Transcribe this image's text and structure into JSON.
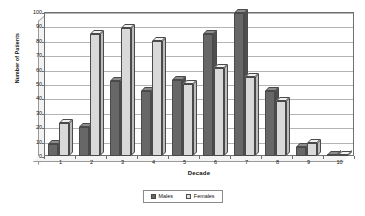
{
  "chart_data": {
    "type": "bar",
    "title": "",
    "xlabel": "Decade",
    "ylabel": "Number of Patients",
    "categories": [
      "1",
      "2",
      "3",
      "4",
      "5",
      "6",
      "7",
      "8",
      "9",
      "10"
    ],
    "series": [
      {
        "name": "Males",
        "values": [
          8,
          20,
          52,
          45,
          53,
          85,
          99,
          45,
          6,
          1
        ]
      },
      {
        "name": "Females",
        "values": [
          23,
          85,
          89,
          80,
          50,
          61,
          55,
          38,
          9,
          1
        ]
      }
    ],
    "ylim": [
      0,
      100
    ],
    "ytick_labels": [
      "0",
      "10",
      "20",
      "30",
      "40",
      "50",
      "60",
      "70",
      "80",
      "90",
      "100"
    ],
    "ytick_values": [
      0,
      10,
      20,
      30,
      40,
      50,
      60,
      70,
      80,
      90,
      100
    ],
    "grid": true,
    "legend_position": "bottom",
    "colors": {
      "males": "#676767",
      "females": "#d9d9d9",
      "gridline": "#b4b4b4",
      "axis": "#6f6f6f",
      "background": "#ffffff"
    }
  }
}
